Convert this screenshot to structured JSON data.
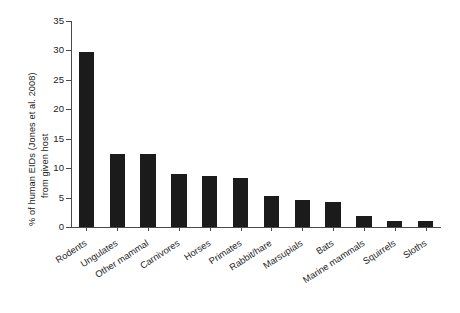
{
  "chart_data": {
    "type": "bar",
    "title": "",
    "subtitle": "",
    "xlabel": "",
    "ylabel": "% of human EIDs (Jones et al. 2008) from given host",
    "ylabel_line1": "% of human EIDs (Jones et al. 2008)",
    "ylabel_line2": "from given host",
    "categories": [
      "Rodents",
      "Ungulates",
      "Other mammal",
      "Carnivores",
      "Horses",
      "Primates",
      "Rabbit/hare",
      "Marsupials",
      "Bats",
      "Marine mammals",
      "Squirrels",
      "Sloths"
    ],
    "values": [
      29.7,
      12.4,
      12.4,
      9.0,
      8.7,
      8.4,
      5.3,
      4.6,
      4.3,
      1.9,
      1.1,
      1.1
    ],
    "ylim": [
      0,
      35
    ],
    "yticks": [
      0,
      5,
      10,
      15,
      20,
      25,
      30,
      35
    ],
    "ytick_labels": [
      "0",
      "5",
      "10",
      "15",
      "20",
      "25",
      "30",
      "35"
    ],
    "grid": false,
    "legend": false,
    "legend_position": "none",
    "bar_color": "#1b1b1b",
    "axis_color": "#4a4a4a",
    "background": "#ffffff"
  }
}
